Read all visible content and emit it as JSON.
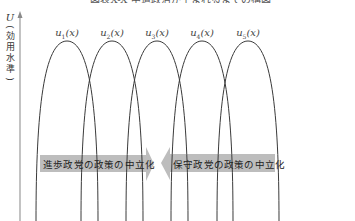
{
  "figure": {
    "title": "図表X-X 中道政治が生まれるまでの構図",
    "y_axis": {
      "symbol": "U",
      "label_vertical": [
        "効",
        "用",
        "水",
        "準"
      ],
      "label": "(効用水準)"
    },
    "curves": [
      {
        "name": "u",
        "sub": "1",
        "arg": "(x)",
        "peak_x": 67
      },
      {
        "name": "u",
        "sub": "2",
        "arg": "(x)",
        "peak_x": 112
      },
      {
        "name": "u",
        "sub": "3",
        "arg": "(x)",
        "peak_x": 157
      },
      {
        "name": "u",
        "sub": "4",
        "arg": "(x)",
        "peak_x": 202
      },
      {
        "name": "u",
        "sub": "5",
        "arg": "(x)",
        "peak_x": 248
      }
    ],
    "arrows": {
      "left_to_right": {
        "label": "進歩政党の政策の中立化",
        "direction": "right"
      },
      "right_to_left": {
        "label": "保守政党の政策の中立化",
        "direction": "left"
      }
    },
    "colors": {
      "curve": "#3a3a3a",
      "axis": "#9a9a9a",
      "arrow_fill": "#bdbdbd",
      "text": "#222222"
    }
  }
}
